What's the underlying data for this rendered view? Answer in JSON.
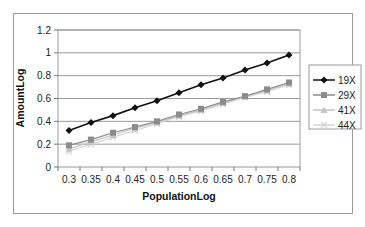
{
  "chart_data": {
    "type": "line",
    "title": "",
    "xlabel": "PopulationLog",
    "ylabel": "AmountLog",
    "x": [
      0.3,
      0.35,
      0.4,
      0.45,
      0.5,
      0.55,
      0.6,
      0.65,
      0.7,
      0.75,
      0.8
    ],
    "x_tick_labels": [
      "0.3",
      "0.35",
      "0.4",
      "0.45",
      "0.5",
      "0.55",
      "0.6",
      "0.65",
      "0.7",
      "0.75",
      "0.8"
    ],
    "y_tick_labels": [
      "0",
      "0.2",
      "0.4",
      "0.6",
      "0.8",
      "1",
      "1.2"
    ],
    "ylim": [
      0,
      1.2
    ],
    "grid": "horizontal",
    "legend_position": "right",
    "series": [
      {
        "name": "19X",
        "color": "#111111",
        "marker": "diamond",
        "values": [
          0.32,
          0.39,
          0.45,
          0.52,
          0.58,
          0.65,
          0.72,
          0.78,
          0.85,
          0.91,
          0.98
        ]
      },
      {
        "name": "29X",
        "color": "#8c8c8c",
        "marker": "square",
        "values": [
          0.19,
          0.24,
          0.3,
          0.35,
          0.4,
          0.46,
          0.51,
          0.57,
          0.62,
          0.68,
          0.74
        ]
      },
      {
        "name": "41X",
        "color": "#c4c4c4",
        "marker": "triangle",
        "values": [
          0.16,
          0.22,
          0.28,
          0.34,
          0.39,
          0.45,
          0.5,
          0.56,
          0.62,
          0.67,
          0.73
        ]
      },
      {
        "name": "44X",
        "color": "#d6d6d6",
        "marker": "x",
        "values": [
          0.14,
          0.2,
          0.26,
          0.32,
          0.38,
          0.44,
          0.49,
          0.55,
          0.61,
          0.66,
          0.72
        ]
      }
    ]
  }
}
